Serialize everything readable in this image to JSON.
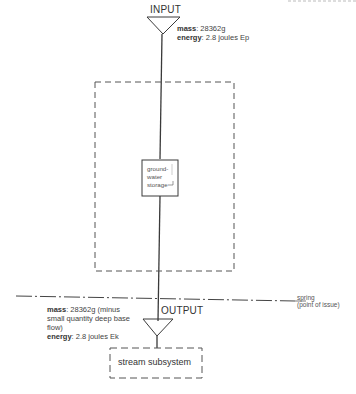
{
  "diagram": {
    "input": {
      "title": "INPUT",
      "mass_label": "mass",
      "mass_value": ": 28362g",
      "energy_label": "energy",
      "energy_value": ": 2.8 joules Ep"
    },
    "storage": {
      "line1": "ground-",
      "line2": "water",
      "line3": "storage"
    },
    "boundary": {
      "label_line1": "spring",
      "label_line2": "(point of issue)"
    },
    "output": {
      "title": "OUTPUT",
      "mass_label": "mass",
      "mass_value_line1": ": 28362g (minus",
      "mass_value_line2": "small quantity deep base",
      "mass_value_line3": "flow)",
      "energy_label": "energy",
      "energy_value": ": 2.8 joules Ek"
    },
    "downstream": {
      "label": "stream subsystem"
    },
    "colors": {
      "line": "#3a3a3a",
      "dashed": "#555555",
      "background": "#ffffff"
    }
  }
}
